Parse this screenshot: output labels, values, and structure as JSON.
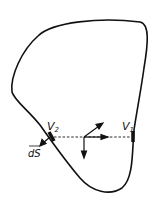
{
  "diagram": {
    "type": "closed volume surface with flux tube",
    "labels": {
      "v1": "V",
      "v1_sub": "1",
      "v2": "V",
      "v2_sub": "2",
      "ds": "dS"
    },
    "colors": {
      "stroke": "#111111",
      "background": "#ffffff"
    }
  }
}
